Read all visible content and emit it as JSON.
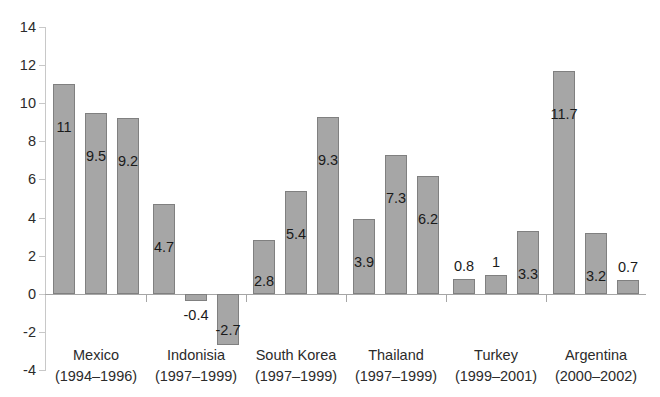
{
  "chart_data": {
    "type": "bar",
    "title": "",
    "subtitle": "",
    "xlabel": "",
    "ylabel": "",
    "ylim": [
      -4,
      14
    ],
    "ytick_step": 2,
    "yticks": [
      "14",
      "12",
      "10",
      "8",
      "6",
      "4",
      "2",
      "0",
      "-2",
      "-4"
    ],
    "grid": false,
    "legend": "none",
    "bar_color": "#a6a6a6",
    "bar_border_color": "#808080",
    "axis_color": "#c8c8c8",
    "zero_line_color": "#a6a6a6",
    "categories": [
      "Mexico",
      "Indonisia",
      "South Korea",
      "Thailand",
      "Turkey",
      "Argentina"
    ],
    "category_years": [
      "(1994–1996)",
      "(1997–1999)",
      "(1997–1999)",
      "(1997–1999)",
      "(1999–2001)",
      "(2000–2002)"
    ],
    "groups": [
      {
        "name": "Mexico",
        "years": "(1994–1996)",
        "values": [
          11,
          9.5,
          9.2
        ],
        "labels": [
          "11",
          "9.5",
          "9.2"
        ]
      },
      {
        "name": "Indonisia",
        "years": "(1997–1999)",
        "values": [
          4.7,
          -0.4,
          -2.7
        ],
        "labels": [
          "4.7",
          "-0.4",
          "-2.7"
        ]
      },
      {
        "name": "South Korea",
        "years": "(1997–1999)",
        "values": [
          2.8,
          5.4,
          9.3
        ],
        "labels": [
          "2.8",
          "5.4",
          "9.3"
        ]
      },
      {
        "name": "Thailand",
        "years": "(1997–1999)",
        "values": [
          3.9,
          7.3,
          6.2
        ],
        "labels": [
          "3.9",
          "7.3",
          "6.2"
        ]
      },
      {
        "name": "Turkey",
        "years": "(1999–2001)",
        "values": [
          0.8,
          1,
          3.3
        ],
        "labels": [
          "0.8",
          "1",
          "3.3"
        ]
      },
      {
        "name": "Argentina",
        "years": "(2000–2002)",
        "values": [
          11.7,
          3.2,
          0.7
        ],
        "labels": [
          "11.7",
          "3.2",
          "0.7"
        ]
      }
    ],
    "series": [
      {
        "name": "Year 1",
        "values": [
          11,
          4.7,
          2.8,
          3.9,
          0.8,
          11.7
        ]
      },
      {
        "name": "Year 2",
        "values": [
          9.5,
          -0.4,
          5.4,
          7.3,
          1,
          3.2
        ]
      },
      {
        "name": "Year 3",
        "values": [
          9.2,
          -2.7,
          9.3,
          6.2,
          3.3,
          0.7
        ]
      }
    ]
  }
}
